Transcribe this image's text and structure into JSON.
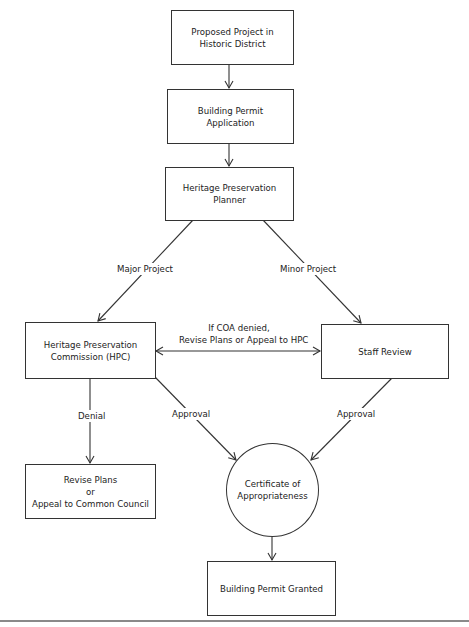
{
  "diagram": {
    "type": "flowchart",
    "nodes": {
      "proposed_project": {
        "lines": [
          "Proposed Project in",
          "Historic District"
        ]
      },
      "permit_application": {
        "lines": [
          "Building Permit",
          "Application"
        ]
      },
      "planner": {
        "lines": [
          "Heritage Preservation",
          "Planner"
        ]
      },
      "hpc": {
        "lines": [
          "Heritage Preservation",
          "Commission (HPC)"
        ]
      },
      "staff_review": {
        "lines": [
          "Staff Review"
        ]
      },
      "revise_appeal": {
        "lines": [
          "Revise Plans",
          "or",
          "Appeal to Common Council"
        ]
      },
      "certificate": {
        "lines": [
          "Certificate of",
          "Appropriateness"
        ],
        "shape": "circle"
      },
      "permit_granted": {
        "lines": [
          "Building Permit Granted"
        ]
      }
    },
    "edge_labels": {
      "major": "Major Project",
      "minor": "Minor Project",
      "coa_denied": [
        "If COA denied,",
        "Revise Plans or Appeal to HPC"
      ],
      "denial": "Denial",
      "approval_hpc": "Approval",
      "approval_staff": "Approval"
    },
    "edges": [
      {
        "from": "proposed_project",
        "to": "permit_application",
        "label": ""
      },
      {
        "from": "permit_application",
        "to": "planner",
        "label": ""
      },
      {
        "from": "planner",
        "to": "hpc",
        "label": "Major Project"
      },
      {
        "from": "planner",
        "to": "staff_review",
        "label": "Minor Project"
      },
      {
        "from": "hpc",
        "to": "staff_review",
        "label": "If COA denied, Revise Plans or Appeal to HPC",
        "bidirectional": true
      },
      {
        "from": "hpc",
        "to": "revise_appeal",
        "label": "Denial"
      },
      {
        "from": "hpc",
        "to": "certificate",
        "label": "Approval"
      },
      {
        "from": "staff_review",
        "to": "certificate",
        "label": "Approval"
      },
      {
        "from": "certificate",
        "to": "permit_granted",
        "label": ""
      }
    ]
  }
}
